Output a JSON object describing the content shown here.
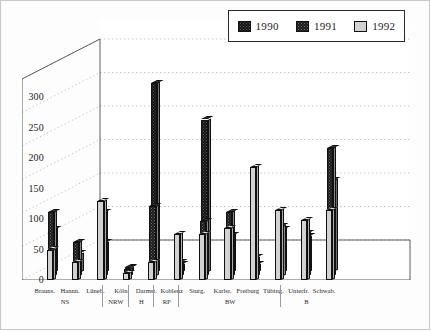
{
  "chart_data": {
    "type": "bar",
    "title": "",
    "subtitle": "",
    "xlabel": "",
    "ylabel": "",
    "ylim": [
      0,
      330
    ],
    "yticks": [
      0,
      50,
      100,
      150,
      200,
      250,
      300
    ],
    "ytick_labels": [
      "0",
      "50",
      "100",
      "150",
      "200",
      "250",
      "300"
    ],
    "grid": true,
    "grid_style": "dotted-horizontal",
    "projection": "3d",
    "legend_position": "top-right",
    "categories": [
      "Brauns.",
      "Hannn.",
      "Lüneb.",
      "Köln",
      "Darmst.",
      "Koblenz",
      "Stutg.",
      "Karlsr.",
      "Freiburg",
      "Tübing.",
      "Unterfr.",
      "Schwab."
    ],
    "groups": [
      {
        "label": "NS",
        "members": [
          "Brauns.",
          "Hannn.",
          "Lüneb."
        ]
      },
      {
        "label": "NRW",
        "members": [
          "Köln"
        ]
      },
      {
        "label": "H",
        "members": [
          "Darmst."
        ]
      },
      {
        "label": "RP",
        "members": [
          "Koblenz"
        ]
      },
      {
        "label": "BW",
        "members": [
          "Stutg.",
          "Karlsr.",
          "Freiburg",
          "Tübing."
        ]
      },
      {
        "label": "B",
        "members": [
          "Unterfr.",
          "Schwab."
        ]
      }
    ],
    "series": [
      {
        "name": "1990",
        "color": "#141414",
        "values": [
          70,
          30,
          48,
          7,
          310,
          12,
          250,
          60,
          12,
          70,
          58,
          150
        ]
      },
      {
        "name": "1991",
        "color": "#1b1b1b",
        "values": [
          105,
          55,
          105,
          12,
          115,
          22,
          90,
          105,
          30,
          82,
          70,
          210
        ]
      },
      {
        "name": "1992",
        "color": "#d2d2d2",
        "values": [
          50,
          30,
          130,
          12,
          30,
          75,
          75,
          85,
          185,
          115,
          98,
          115
        ]
      }
    ],
    "legend": [
      {
        "label": "1990",
        "swatch": "dark-dotted"
      },
      {
        "label": "1991",
        "swatch": "dark-dotted"
      },
      {
        "label": "1992",
        "swatch": "light-gray"
      }
    ]
  }
}
